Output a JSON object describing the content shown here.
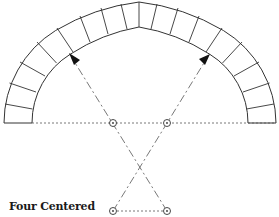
{
  "diagram": {
    "title": "Four Centered",
    "type": "four-centered arch construction",
    "colors": {
      "line": "#333333",
      "background": "#ffffff"
    },
    "centers": [
      {
        "name": "left-springing-center",
        "x": 113,
        "y": 123
      },
      {
        "name": "right-springing-center",
        "x": 167,
        "y": 123
      },
      {
        "name": "left-lower-center",
        "x": 113,
        "y": 211
      },
      {
        "name": "right-lower-center",
        "x": 167,
        "y": 211
      }
    ],
    "voussoir_count_per_side": 10
  }
}
